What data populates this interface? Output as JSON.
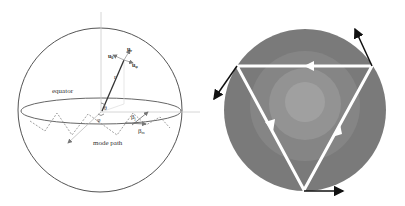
{
  "left_figure": {
    "labels": {
      "equator": "equator",
      "mode_path": "mode path",
      "r": "r",
      "theta": "θ",
      "phi": "φ",
      "u_theta": "u",
      "u_theta_sub": "θ",
      "u_r": "u",
      "u_r_sub": "r",
      "u_phi": "u",
      "u_phi_sub": "φ",
      "beta_j": "β",
      "beta_j_sub": "j",
      "beta_m": "β",
      "beta_m_sub": "m"
    },
    "colors": {
      "line": "#555555",
      "dashed": "#888888",
      "axis": "#bbbbbb"
    }
  },
  "right_figure": {
    "colors": {
      "outer": "#7a7a7a",
      "ring2": "#868686",
      "ring3": "#939393",
      "center": "#a0a0a0",
      "triangle": "#ffffff",
      "tangent_arrows": "#111111"
    }
  }
}
